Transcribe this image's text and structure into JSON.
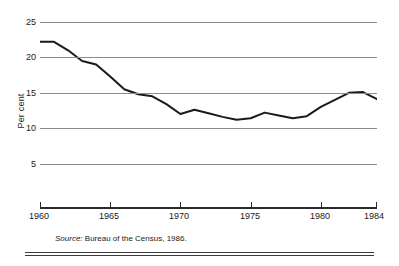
{
  "chart_data": {
    "type": "line",
    "title": "",
    "xlabel": "",
    "ylabel": "Per cent",
    "xlim": [
      1960,
      1984
    ],
    "ylim": [
      0,
      25
    ],
    "grid": true,
    "legend": null,
    "line_color": "#1a1a1a",
    "grid_color": "#8c8c8c",
    "x": [
      1960,
      1961,
      1962,
      1963,
      1964,
      1965,
      1966,
      1967,
      1968,
      1969,
      1970,
      1971,
      1972,
      1973,
      1974,
      1975,
      1976,
      1977,
      1978,
      1979,
      1980,
      1981,
      1982,
      1983,
      1984
    ],
    "values": [
      22.2,
      22.2,
      21.0,
      19.5,
      19.0,
      17.3,
      15.5,
      14.8,
      14.5,
      13.4,
      12.0,
      12.6,
      12.1,
      11.6,
      11.2,
      11.4,
      12.2,
      11.8,
      11.4,
      11.7,
      13.0,
      14.0,
      15.0,
      15.1,
      14.1
    ],
    "y_ticks": [
      25,
      20,
      15,
      10,
      5
    ],
    "x_ticks": [
      1960,
      1965,
      1970,
      1975,
      1980,
      1984
    ],
    "source_note": {
      "label": "Source:",
      "text": " Bureau of the Census, 1986."
    }
  }
}
